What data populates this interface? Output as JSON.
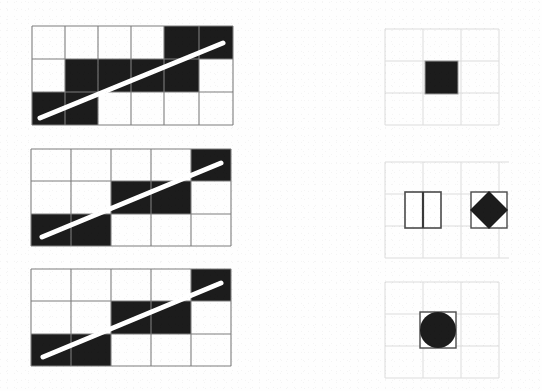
{
  "figure": {
    "title": "",
    "caption": "",
    "background_color": "#fefefe",
    "ink_color": "#1a1a1a",
    "grid_line_color": "#7d7d7d",
    "faint_grid_color": "#d8d8d8",
    "fill_black": "#1c1c1c",
    "line_white": "#ffffff"
  },
  "rows": [
    {
      "id": "row-1",
      "left": {
        "name": "grid-diagram-1",
        "x": 31,
        "y": 25,
        "width": 201,
        "height": 99,
        "cols": 6,
        "rows": 3,
        "col_edges": [
          0,
          33,
          66,
          99,
          132,
          167,
          201
        ],
        "row_edges": [
          0,
          33,
          66,
          99
        ],
        "filled_cells": [
          {
            "r": 0,
            "c": 4
          },
          {
            "r": 0,
            "c": 5
          },
          {
            "r": 1,
            "c": 1
          },
          {
            "r": 1,
            "c": 2
          },
          {
            "r": 1,
            "c": 3
          },
          {
            "r": 1,
            "c": 4
          },
          {
            "r": 2,
            "c": 0
          },
          {
            "r": 2,
            "c": 1
          }
        ],
        "diagonal": {
          "x1": 8,
          "y1": 92,
          "x2": 191,
          "y2": 17,
          "stroke_width": 5
        }
      },
      "right": {
        "name": "shape-panel-1",
        "x": 383,
        "y": 27,
        "width": 118,
        "height": 100,
        "faint_grid": {
          "cols": 3,
          "rows": 3,
          "cell": 38
        },
        "shapes": [
          {
            "kind": "filled-square",
            "name": "filled-square-shape",
            "cx": 59,
            "cy": 50,
            "size": 33
          }
        ]
      }
    },
    {
      "id": "row-2",
      "left": {
        "name": "grid-diagram-2",
        "x": 30,
        "y": 148,
        "width": 200,
        "height": 97,
        "cols": 5,
        "rows": 3,
        "col_edges": [
          0,
          40,
          80,
          120,
          160,
          200
        ],
        "row_edges": [
          0,
          32,
          65,
          97
        ],
        "filled_cells": [
          {
            "r": 0,
            "c": 4
          },
          {
            "r": 1,
            "c": 2
          },
          {
            "r": 1,
            "c": 3
          },
          {
            "r": 2,
            "c": 0
          },
          {
            "r": 2,
            "c": 1
          }
        ],
        "diagonal": {
          "x1": 11,
          "y1": 88,
          "x2": 190,
          "y2": 14,
          "stroke_width": 5
        }
      },
      "right": {
        "name": "shape-panel-2",
        "x": 383,
        "y": 160,
        "width": 128,
        "height": 100,
        "faint_grid": {
          "cols": 3,
          "rows": 3,
          "cell": 38
        },
        "shapes": [
          {
            "kind": "split-square",
            "name": "split-square-shape",
            "cx": 40,
            "cy": 50,
            "size": 36
          },
          {
            "kind": "diamond-in-square",
            "name": "diamond-in-square-shape",
            "cx": 106,
            "cy": 50,
            "size": 36
          }
        ]
      }
    },
    {
      "id": "row-3",
      "left": {
        "name": "grid-diagram-3",
        "x": 30,
        "y": 268,
        "width": 200,
        "height": 97,
        "cols": 5,
        "rows": 3,
        "col_edges": [
          0,
          40,
          80,
          120,
          160,
          200
        ],
        "row_edges": [
          0,
          32,
          65,
          97
        ],
        "filled_cells": [
          {
            "r": 0,
            "c": 4
          },
          {
            "r": 1,
            "c": 2
          },
          {
            "r": 1,
            "c": 3
          },
          {
            "r": 2,
            "c": 0
          },
          {
            "r": 2,
            "c": 1
          }
        ],
        "diagonal": {
          "x1": 12,
          "y1": 88,
          "x2": 190,
          "y2": 14,
          "stroke_width": 5
        }
      },
      "right": {
        "name": "shape-panel-3",
        "x": 383,
        "y": 280,
        "width": 118,
        "height": 100,
        "faint_grid": {
          "cols": 3,
          "rows": 3,
          "cell": 38
        },
        "shapes": [
          {
            "kind": "circle-in-square",
            "name": "circle-in-square-shape",
            "cx": 55,
            "cy": 50,
            "size": 36
          }
        ]
      }
    }
  ]
}
